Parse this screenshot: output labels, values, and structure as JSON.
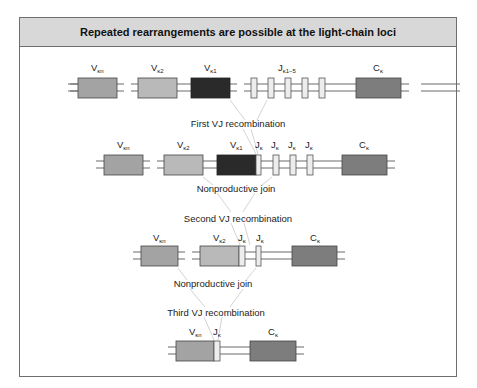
{
  "title": "Repeated rearrangements are possible at the light-chain loci",
  "colors": {
    "v_kn": "#a3a3a3",
    "v_k2": "#b9b9b9",
    "v_k1": "#2a2a2a",
    "j": "#ededed",
    "c_k": "#7d7d7d",
    "line": "#6a6a6a",
    "guide": "#c8c8c8",
    "header_bg": "#d8d8d8"
  },
  "captions": {
    "first": "First VJ recombination",
    "nonprod1": "Nonproductive join",
    "second": "Second VJ recombination",
    "nonprod2": "Nonproductive join",
    "third": "Third VJ recombination"
  },
  "rows": [
    {
      "name": "germline",
      "labels": [
        {
          "main": "V",
          "sub": "κn"
        },
        {
          "main": "V",
          "sub": "κ2"
        },
        {
          "main": "V",
          "sub": "κ1"
        },
        {
          "main": "J",
          "sub": "κ1–5"
        },
        {
          "main": "C",
          "sub": "κ"
        }
      ]
    },
    {
      "name": "after-first-recombination",
      "labels": [
        {
          "main": "V",
          "sub": "κn"
        },
        {
          "main": "V",
          "sub": "κ2"
        },
        {
          "main": "V",
          "sub": "κ1"
        },
        {
          "main": "J",
          "sub": "κ"
        },
        {
          "main": "J",
          "sub": "κ"
        },
        {
          "main": "J",
          "sub": "κ"
        },
        {
          "main": "J",
          "sub": "κ"
        },
        {
          "main": "C",
          "sub": "κ"
        }
      ]
    },
    {
      "name": "after-second-recombination",
      "labels": [
        {
          "main": "V",
          "sub": "κn"
        },
        {
          "main": "V",
          "sub": "κ2"
        },
        {
          "main": "J",
          "sub": "κ"
        },
        {
          "main": "J",
          "sub": "κ"
        },
        {
          "main": "C",
          "sub": "κ"
        }
      ]
    },
    {
      "name": "after-third-recombination",
      "labels": [
        {
          "main": "V",
          "sub": "κn"
        },
        {
          "main": "J",
          "sub": "κ"
        },
        {
          "main": "C",
          "sub": "κ"
        }
      ]
    }
  ]
}
